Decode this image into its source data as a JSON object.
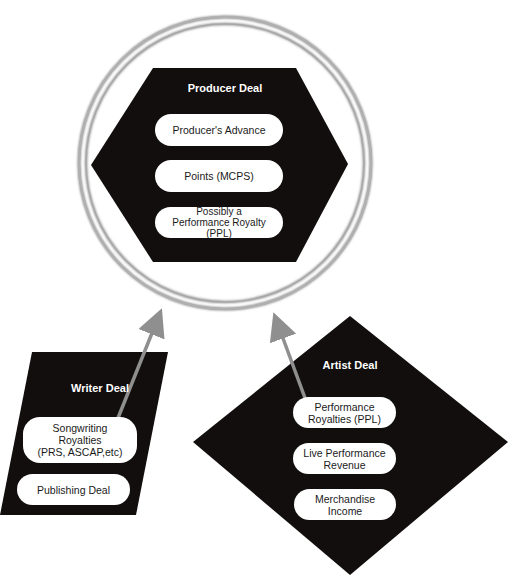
{
  "diagram": {
    "producer_deal": {
      "title": "Producer Deal",
      "shape": "hexagon",
      "items": [
        {
          "label": "Producer's Advance"
        },
        {
          "label": "Points (MCPS)"
        },
        {
          "label": "Possibly a\nPerformance Royalty\n(PPL)"
        }
      ]
    },
    "writer_deal": {
      "title": "Writer Deal",
      "shape": "parallelogram",
      "items": [
        {
          "label": "Songwriting\nRoyalties\n(PRS, ASCAP,etc)"
        },
        {
          "label": "Publishing Deal"
        }
      ]
    },
    "artist_deal": {
      "title": "Artist Deal",
      "shape": "diamond",
      "items": [
        {
          "label": "Performance\nRoyalties (PPL)"
        },
        {
          "label": "Live Performance\nRevenue"
        },
        {
          "label": "Merchandise\nIncome"
        }
      ]
    },
    "connections": [
      {
        "from": "Songwriting Royalties (PRS, ASCAP,etc)",
        "to": "Producer Deal"
      },
      {
        "from": "Performance Royalties (PPL)",
        "to": "Producer Deal"
      }
    ],
    "colors": {
      "shape_fill": "#120e0e",
      "pill_fill": "#ffffff",
      "arrow": "#8f8f8f",
      "ring": "#9a9a9a"
    }
  }
}
